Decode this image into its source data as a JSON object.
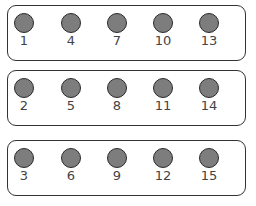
{
  "groups": [
    {
      "labels": [
        "1",
        "4",
        "7",
        "10",
        "13"
      ]
    },
    {
      "labels": [
        "2",
        "5",
        "8",
        "11",
        "14"
      ]
    },
    {
      "labels": [
        "3",
        "6",
        "9",
        "12",
        "15"
      ]
    }
  ],
  "colors": {
    "dot_fill": "#7d7d7d",
    "outline": "#333333",
    "label": "#444444"
  }
}
